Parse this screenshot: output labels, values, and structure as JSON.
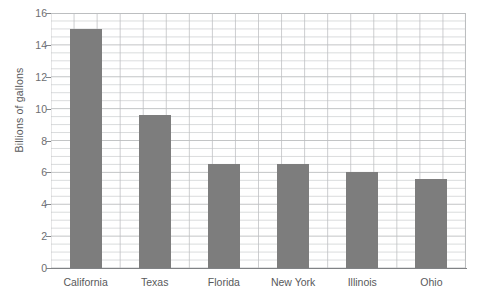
{
  "chart_data": {
    "type": "bar",
    "title": "",
    "xlabel": "",
    "ylabel": "Billions of gallons",
    "categories": [
      "California",
      "Texas",
      "Florida",
      "New York",
      "Illinois",
      "Ohio"
    ],
    "values": [
      15.0,
      9.6,
      6.5,
      6.5,
      6.0,
      5.6
    ],
    "ylim": [
      0,
      16
    ],
    "yticks": [
      0,
      2,
      4,
      6,
      8,
      10,
      12,
      14,
      16
    ],
    "ytick_labels": [
      "0",
      "2",
      "4",
      "6",
      "8",
      "10",
      "12",
      "14",
      "16"
    ],
    "grid": true,
    "grid_minor": true,
    "legend": "none",
    "bar_color": "#7d7d7d",
    "grid_color": "#bcbec0",
    "axis_color": "#808285",
    "text_color": "#58595b"
  }
}
